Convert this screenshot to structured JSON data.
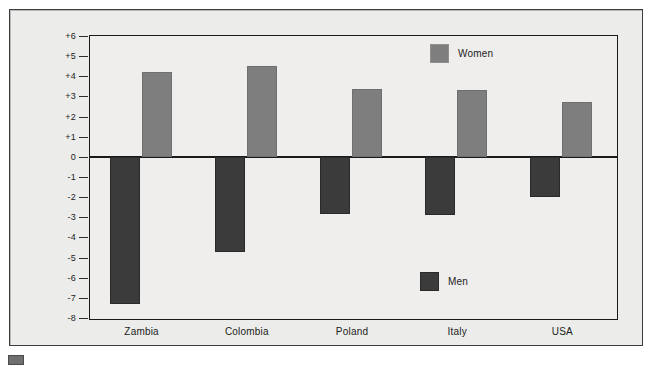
{
  "chart_data": {
    "type": "bar",
    "title": "",
    "subtitle": "",
    "xlabel": "",
    "ylabel": "Preferred Age Difference (Years)",
    "categories": [
      "Zambia",
      "Colombia",
      "Poland",
      "Italy",
      "USA"
    ],
    "series": [
      {
        "name": "Men",
        "color": "#3b3b3b",
        "values": [
          -7.3,
          -4.7,
          -2.85,
          -2.9,
          -2.0
        ]
      },
      {
        "name": "Women",
        "color": "#7e7e7e",
        "values": [
          4.2,
          4.5,
          3.35,
          3.3,
          2.7
        ]
      }
    ],
    "ylim": [
      -8,
      6
    ],
    "ytick_labels": [
      "+6",
      "+5",
      "+4",
      "+3",
      "+2",
      "+1",
      "0",
      "-1",
      "-2",
      "-3",
      "-4",
      "-5",
      "-6",
      "-7",
      "-8"
    ],
    "ytick_values": [
      6,
      5,
      4,
      3,
      2,
      1,
      0,
      -1,
      -2,
      -3,
      -4,
      -5,
      -6,
      -7,
      -8
    ],
    "grid": false,
    "zero_line": true,
    "legend": [
      {
        "label": "Women",
        "color": "#7e7e7e",
        "position": "top-right"
      },
      {
        "label": "Men",
        "color": "#3b3b3b",
        "position": "bottom-right"
      }
    ],
    "annotations": []
  },
  "figure": {
    "background_color": "#ececea",
    "plot_background_color": "#efeeec",
    "frame_color": "#1a1a1a"
  }
}
